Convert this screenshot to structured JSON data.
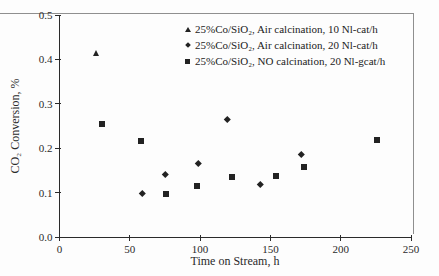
{
  "frame": {
    "border_color": "#8f8f8f"
  },
  "chart_data": {
    "type": "scatter",
    "title": "",
    "xlabel": "Time on Stream, h",
    "ylabel": "CO₂ Conversion, %",
    "xlim": [
      0,
      250
    ],
    "ylim": [
      0,
      0.5
    ],
    "x_ticks": [
      "0",
      "50",
      "100",
      "150",
      "200",
      "250"
    ],
    "y_ticks": [
      "0.0",
      "0.1",
      "0.2",
      "0.3",
      "0.4",
      "0.5"
    ],
    "grid": false,
    "legend_position": "top-right",
    "marker_color": "#222222",
    "series": [
      {
        "name": "25%Co/SiO₂, Air calcination, 10 Nl-cat/h",
        "marker": "triangle",
        "color": "#222222",
        "points": [
          [
            26,
            0.415
          ]
        ]
      },
      {
        "name": "25%Co/SiO₂, Air calcination, 20 Nl-cat/h",
        "marker": "diamond",
        "color": "#222222",
        "points": [
          [
            59,
            0.098
          ],
          [
            75,
            0.141
          ],
          [
            99,
            0.166
          ],
          [
            119,
            0.265
          ],
          [
            143,
            0.12
          ],
          [
            172,
            0.187
          ]
        ]
      },
      {
        "name": "25%Co/SiO₂, NO calcination, 20 Nl-gcat/h",
        "marker": "square",
        "color": "#222222",
        "points": [
          [
            30,
            0.254
          ],
          [
            58,
            0.217
          ],
          [
            76,
            0.097
          ],
          [
            98,
            0.116
          ],
          [
            123,
            0.135
          ],
          [
            154,
            0.138
          ],
          [
            174,
            0.157
          ],
          [
            226,
            0.218
          ]
        ]
      }
    ]
  }
}
